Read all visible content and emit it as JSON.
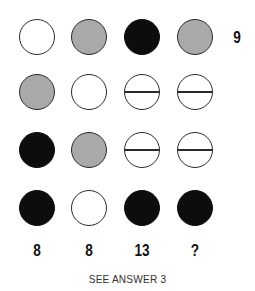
{
  "puzzle": {
    "rows": [
      {
        "circles": [
          "white",
          "grey",
          "black",
          "grey"
        ],
        "total": "9"
      },
      {
        "circles": [
          "grey",
          "white",
          "split",
          "split"
        ],
        "total": ""
      },
      {
        "circles": [
          "black",
          "grey",
          "split",
          "split"
        ],
        "total": ""
      },
      {
        "circles": [
          "black",
          "white",
          "black",
          "black"
        ],
        "total": ""
      }
    ],
    "column_totals": [
      "8",
      "8",
      "13",
      "?"
    ],
    "footer": "SEE ANSWER 3"
  },
  "colors": {
    "white": "#ffffff",
    "grey": "#a9a9a9",
    "black": "#0d0d0d",
    "outline": "#2a2a2a"
  }
}
